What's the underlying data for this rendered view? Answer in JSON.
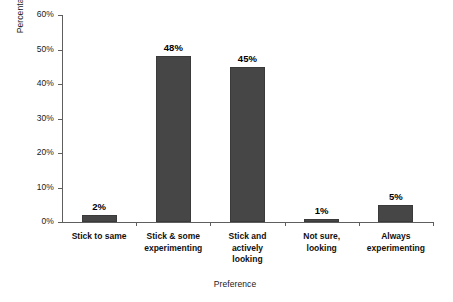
{
  "chart_data": {
    "type": "bar",
    "title": "",
    "xlabel": "Preference",
    "ylabel": "Percentage of respondents",
    "categories": [
      "Stick to same",
      "Stick & some experimenting",
      "Stick and actively looking",
      "Not sure, looking",
      "Always experimenting"
    ],
    "category_lines": [
      [
        "Stick to same"
      ],
      [
        "Stick & some",
        "experimenting"
      ],
      [
        "Stick and",
        "actively",
        "looking"
      ],
      [
        "Not sure,",
        "looking"
      ],
      [
        "Always",
        "experimenting"
      ]
    ],
    "values": [
      2,
      48,
      45,
      1,
      5
    ],
    "data_labels": [
      "2%",
      "48%",
      "45%",
      "1%",
      "5%"
    ],
    "ylim": [
      0,
      60
    ],
    "ytick_values": [
      0,
      10,
      20,
      30,
      40,
      50,
      60
    ],
    "ytick_labels": [
      "0%",
      "10%",
      "20%",
      "30%",
      "40%",
      "50%",
      "60%"
    ],
    "grid": false,
    "legend": false,
    "legend_position": "none",
    "bar_color": "#464646",
    "axis_color": "#5e5e5e",
    "background_color": "#ffffff"
  }
}
